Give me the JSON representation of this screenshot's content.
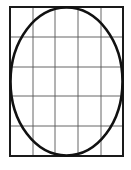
{
  "diagram": {
    "canvas": {
      "width": 131,
      "height": 170
    },
    "rectangle": {
      "x": 10,
      "y": 7,
      "width": 113,
      "height": 149,
      "stroke": "#1a1a1a",
      "stroke_width": 2
    },
    "grid": {
      "columns": 5,
      "rows": 5,
      "vertical_lines_x": [
        33,
        55,
        78,
        101
      ],
      "horizontal_lines_y": [
        37,
        67,
        96,
        126
      ],
      "stroke": "#555555",
      "stroke_width": 0.9
    },
    "ellipse": {
      "cx": 66.5,
      "cy": 81.5,
      "rx": 56,
      "ry": 74,
      "stroke": "#111111",
      "stroke_width": 2.6,
      "fill": "none"
    },
    "background": "#ffffff"
  }
}
